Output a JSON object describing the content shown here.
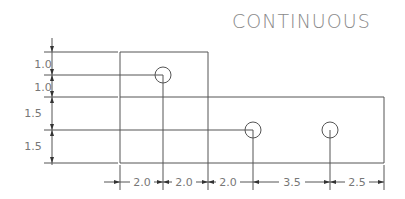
{
  "title": "CONTINUOUS",
  "vertical_dims": [
    "1.0",
    "1.0",
    "1.5",
    "1.5"
  ],
  "horizontal_dims": [
    "2.0",
    "2.0",
    "2.0",
    "3.5",
    "2.5"
  ],
  "colors": {
    "line": "#555555",
    "text": "#777777",
    "title": "#8a8a8a"
  }
}
